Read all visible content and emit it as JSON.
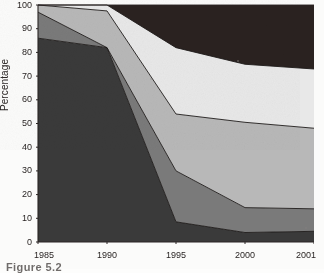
{
  "figure": {
    "caption": "Figure 5.2",
    "caption_clipped": true
  },
  "axes": {
    "y_title": "Percentage",
    "y_ticks": [
      "0",
      "10",
      "20",
      "30",
      "40",
      "50",
      "60",
      "70",
      "80",
      "90",
      "100"
    ],
    "x_ticks": [
      "1985",
      "1990",
      "1995",
      "2000",
      "2001"
    ]
  },
  "chart_data": {
    "type": "area",
    "title": "",
    "subtitle": "",
    "xlabel": "",
    "ylabel": "Percentage",
    "categories": [
      "1985",
      "1990",
      "1995",
      "2000",
      "2001"
    ],
    "x_spacing": "equal",
    "stacked": true,
    "stack_total": 100,
    "ylim": [
      0,
      100
    ],
    "y_tick_step": 10,
    "grid": false,
    "legend": "none",
    "annotations": [],
    "series": [
      {
        "name": "Band 1 (bottom)",
        "color": "#3a3a3a",
        "values": [
          86,
          82,
          8.5,
          4,
          4.5
        ],
        "cumulative_top": [
          86,
          82,
          8.5,
          4,
          4.5
        ]
      },
      {
        "name": "Band 2",
        "color": "#7a7a7a",
        "values": [
          11,
          0,
          21.5,
          10.5,
          9.5
        ],
        "cumulative_top": [
          97,
          82,
          30,
          14.5,
          14
        ]
      },
      {
        "name": "Band 3",
        "color": "#b8b8b8",
        "values": [
          3,
          15.5,
          24,
          36,
          34
        ],
        "cumulative_top": [
          100,
          97.5,
          54,
          50.5,
          48
        ]
      },
      {
        "name": "Band 4",
        "color": "#e8e8e8",
        "values": [
          0,
          2.5,
          28,
          24.5,
          25
        ],
        "cumulative_top": [
          100,
          100,
          82,
          75,
          73
        ]
      },
      {
        "name": "Band 5 (top)",
        "color": "#2a2220",
        "values": [
          0,
          0,
          18,
          25,
          27
        ],
        "cumulative_top": [
          100,
          100,
          100,
          100,
          100
        ]
      }
    ]
  },
  "style": {
    "axis_color": "#2a2524",
    "outline_color": "#1d1a19",
    "paper_color": "#fbfbfa"
  }
}
